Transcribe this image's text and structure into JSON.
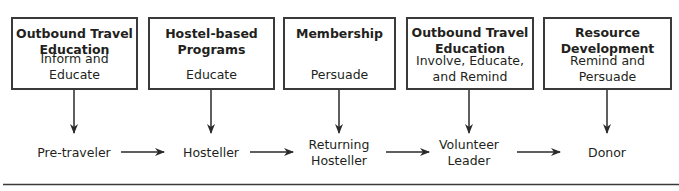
{
  "diagram": {
    "programs": [
      {
        "title_line1": "Outbound Travel",
        "title_line2": "Education",
        "action_line1": "Inform and Educate",
        "action_line2": ""
      },
      {
        "title_line1": "Hostel-based",
        "title_line2": "Programs",
        "action_line1": "Educate",
        "action_line2": ""
      },
      {
        "title_line1": "Membership",
        "title_line2": "",
        "action_line1": "Persuade",
        "action_line2": ""
      },
      {
        "title_line1": "Outbound Travel",
        "title_line2": "Education",
        "action_line1": "Involve, Educate,",
        "action_line2": "and Remind"
      },
      {
        "title_line1": "Resource",
        "title_line2": "Development",
        "action_line1": "Remind and",
        "action_line2": "Persuade"
      }
    ],
    "stages": [
      {
        "line1": "Pre-traveler",
        "line2": ""
      },
      {
        "line1": "Hosteller",
        "line2": ""
      },
      {
        "line1": "Returning",
        "line2": "Hosteller"
      },
      {
        "line1": "Volunteer",
        "line2": "Leader"
      },
      {
        "line1": "Donor",
        "line2": ""
      }
    ],
    "colors": {
      "line": "#3a3a3a",
      "text": "#231f20",
      "background": "#ffffff"
    }
  }
}
